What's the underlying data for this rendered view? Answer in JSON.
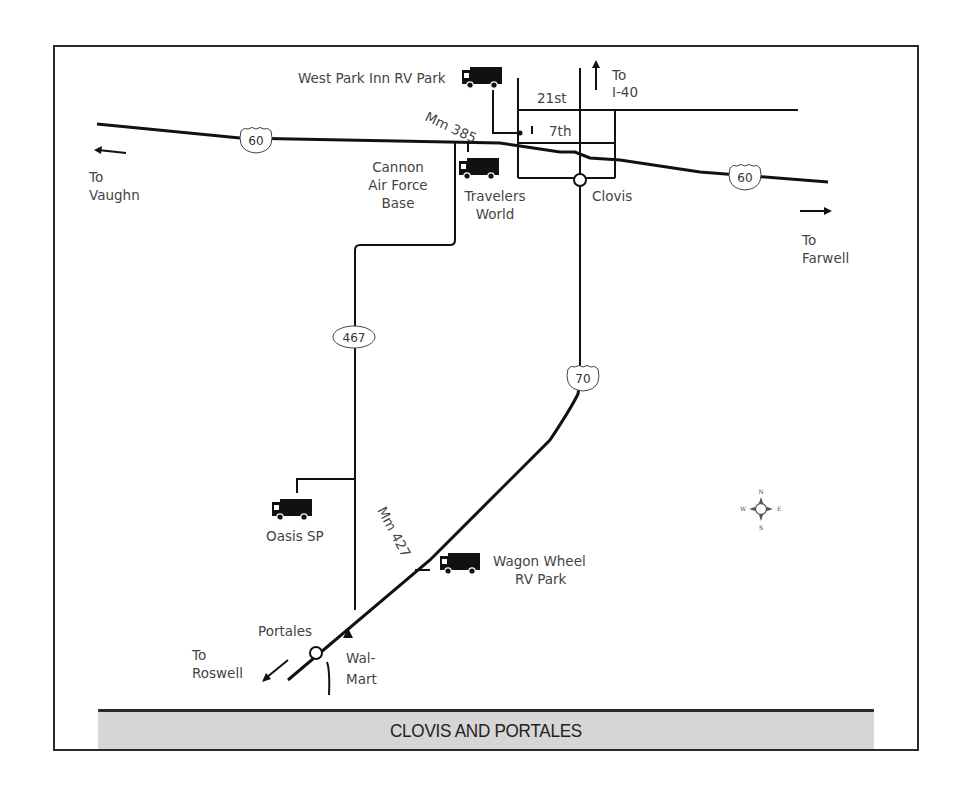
{
  "map": {
    "title": "CLOVIS AND PORTALES",
    "routes": {
      "us60_west": "60",
      "us60_east": "60",
      "nm467": "467",
      "us70": "70"
    },
    "places": {
      "clovis": "Clovis",
      "portales": "Portales",
      "cannon_line1": "Cannon",
      "cannon_line2": "Air Force",
      "cannon_line3": "Base",
      "walmart_line1": "Wal-",
      "walmart_line2": "Mart"
    },
    "streets": {
      "s21st": "21st",
      "s7th": "7th"
    },
    "mile_markers": {
      "mm385": "Mm 385",
      "mm427": "Mm 427"
    },
    "directions": {
      "vaughn_line1": "To",
      "vaughn_line2": "Vaughn",
      "farwell_line1": "To",
      "farwell_line2": "Farwell",
      "i40_line1": "To",
      "i40_line2": "I-40",
      "roswell_line1": "To",
      "roswell_line2": "Roswell"
    },
    "rv_parks": {
      "west_park": "West Park Inn RV Park",
      "travelers_line1": "Travelers",
      "travelers_line2": "World",
      "oasis": "Oasis SP",
      "wagon_line1": "Wagon Wheel",
      "wagon_line2": "RV Park"
    },
    "compass": {
      "n": "N",
      "s": "S",
      "e": "E",
      "w": "W"
    }
  }
}
